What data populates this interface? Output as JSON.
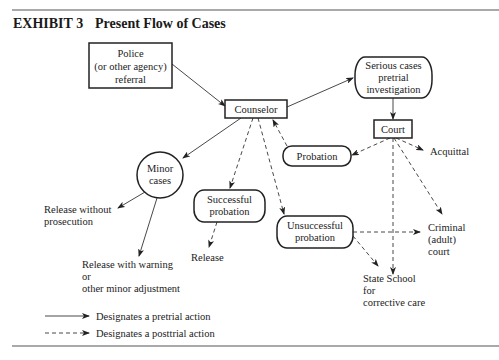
{
  "exhibit": {
    "label": "EXHIBIT 3",
    "title": "Present Flow of Cases"
  },
  "nodes": {
    "police": [
      "Police",
      "(or other agency)",
      "referral"
    ],
    "counselor": "Counselor",
    "serious_cases": [
      "Serious cases",
      "pretrial",
      "investigation"
    ],
    "court": "Court",
    "probation": "Probation",
    "minor_cases": [
      "Minor",
      "cases"
    ],
    "successful_probation": [
      "Successful",
      "probation"
    ],
    "unsuccessful_probation": [
      "Unsuccessful",
      "probation"
    ]
  },
  "outcomes": {
    "release_without_prosecution": [
      "Release without",
      "prosecution"
    ],
    "release": "Release",
    "release_with_warning": [
      "Release with warning",
      "or",
      "other minor adjustment"
    ],
    "acquittal": "Acquittal",
    "criminal_court": [
      "Criminal",
      "(adult)",
      "court"
    ],
    "state_school": [
      "State School",
      "for",
      "corrective care"
    ]
  },
  "legend": {
    "pretrial": "Designates a pretrial action",
    "posttrial": "Designates a posttrial action"
  },
  "edges": [
    {
      "from": "police",
      "to": "counselor",
      "type": "pretrial"
    },
    {
      "from": "counselor",
      "to": "serious_cases",
      "type": "pretrial"
    },
    {
      "from": "serious_cases",
      "to": "court",
      "type": "pretrial"
    },
    {
      "from": "counselor",
      "to": "minor_cases",
      "type": "pretrial"
    },
    {
      "from": "minor_cases",
      "to": "release_without_prosecution",
      "type": "pretrial"
    },
    {
      "from": "minor_cases",
      "to": "release_with_warning",
      "type": "pretrial"
    },
    {
      "from": "counselor",
      "to": "successful_probation",
      "type": "posttrial"
    },
    {
      "from": "counselor",
      "to": "unsuccessful_probation",
      "type": "posttrial"
    },
    {
      "from": "probation",
      "to": "counselor",
      "type": "posttrial"
    },
    {
      "from": "successful_probation",
      "to": "release",
      "type": "posttrial"
    },
    {
      "from": "court",
      "to": "probation",
      "type": "posttrial"
    },
    {
      "from": "court",
      "to": "acquittal",
      "type": "posttrial"
    },
    {
      "from": "court",
      "to": "criminal_court",
      "type": "posttrial"
    },
    {
      "from": "court",
      "to": "state_school",
      "type": "posttrial"
    },
    {
      "from": "unsuccessful_probation",
      "to": "criminal_court",
      "type": "posttrial"
    },
    {
      "from": "unsuccessful_probation",
      "to": "state_school",
      "type": "posttrial"
    }
  ]
}
